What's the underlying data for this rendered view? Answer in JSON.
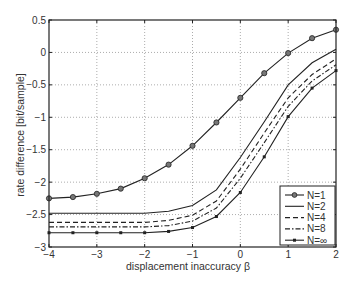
{
  "chart_data": {
    "type": "line",
    "title": "",
    "xlabel": "displacement inaccuracy β",
    "ylabel": "rate difference [bit/sample]",
    "xlim": [
      -4,
      2
    ],
    "ylim": [
      -3,
      0.5
    ],
    "xticks": [
      -4,
      -3,
      -2,
      -1,
      0,
      1,
      2
    ],
    "yticks": [
      0.5,
      0,
      -0.5,
      -1,
      -1.5,
      -2,
      -2.5,
      -3
    ],
    "xtick_labels": [
      "−4",
      "−3",
      "−2",
      "−1",
      "0",
      "1",
      "2"
    ],
    "ytick_labels": [
      "0.5",
      "0",
      "−0.5",
      "−1",
      "−1.5",
      "−2",
      "−2.5",
      "−3"
    ],
    "grid": true,
    "legend_position": "lower right",
    "x": [
      -4,
      -3.5,
      -3,
      -2.5,
      -2,
      -1.5,
      -1,
      -0.5,
      0,
      0.5,
      1,
      1.5,
      2
    ],
    "series": [
      {
        "name": "N=1",
        "style": "solid-circle",
        "values": [
          -2.25,
          -2.23,
          -2.18,
          -2.1,
          -1.94,
          -1.73,
          -1.44,
          -1.08,
          -0.7,
          -0.32,
          -0.01,
          0.22,
          0.35
        ]
      },
      {
        "name": "N=2",
        "style": "solid",
        "values": [
          -2.48,
          -2.48,
          -2.48,
          -2.48,
          -2.48,
          -2.45,
          -2.36,
          -2.12,
          -1.62,
          -1.07,
          -0.5,
          -0.16,
          0.05
        ]
      },
      {
        "name": "N=4",
        "style": "dashed",
        "values": [
          -2.62,
          -2.62,
          -2.62,
          -2.62,
          -2.62,
          -2.59,
          -2.51,
          -2.29,
          -1.8,
          -1.24,
          -0.7,
          -0.34,
          -0.1
        ]
      },
      {
        "name": "N=8",
        "style": "dashdot",
        "values": [
          -2.69,
          -2.69,
          -2.69,
          -2.69,
          -2.69,
          -2.67,
          -2.6,
          -2.4,
          -1.94,
          -1.39,
          -0.83,
          -0.44,
          -0.19
        ]
      },
      {
        "name": "N=∞",
        "style": "solid-dot",
        "values": [
          -2.78,
          -2.78,
          -2.78,
          -2.78,
          -2.78,
          -2.76,
          -2.7,
          -2.53,
          -2.16,
          -1.61,
          -0.99,
          -0.55,
          -0.28
        ]
      }
    ]
  }
}
